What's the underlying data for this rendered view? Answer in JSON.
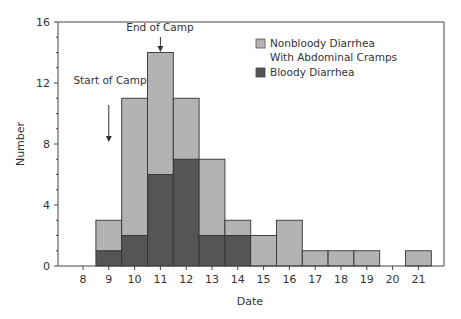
{
  "chart_data": {
    "type": "bar",
    "stacked": true,
    "title": "",
    "xlabel": "Date",
    "ylabel": "Number",
    "ylim": [
      0,
      16
    ],
    "yticks": [
      0,
      4,
      8,
      12,
      16
    ],
    "categories": [
      "8",
      "9",
      "10",
      "11",
      "12",
      "13",
      "14",
      "15",
      "16",
      "17",
      "18",
      "19",
      "20",
      "21"
    ],
    "series": [
      {
        "name": "Bloody Diarrhea",
        "color": "#555555",
        "values": [
          0,
          1,
          2,
          6,
          7,
          2,
          2,
          0,
          0,
          0,
          0,
          0,
          0,
          0
        ]
      },
      {
        "name": "Nonbloody Diarrhea With Abdominal Cramps",
        "color": "#b3b3b3",
        "values": [
          0,
          2,
          9,
          8,
          4,
          5,
          1,
          2,
          3,
          1,
          1,
          1,
          0,
          1
        ]
      }
    ],
    "totals": [
      0,
      3,
      11,
      14,
      11,
      7,
      3,
      2,
      3,
      1,
      1,
      1,
      0,
      1
    ],
    "annotations": [
      {
        "text": "Start of Camp",
        "x": "9",
        "arrow": "down"
      },
      {
        "text": "End of Camp",
        "x": "11",
        "arrow": "down"
      }
    ],
    "legend": {
      "position": "upper-right-inside",
      "entries": [
        "Nonbloody Diarrhea",
        "With Abdominal Cramps",
        "Bloody Diarrhea"
      ]
    },
    "grid": false
  }
}
